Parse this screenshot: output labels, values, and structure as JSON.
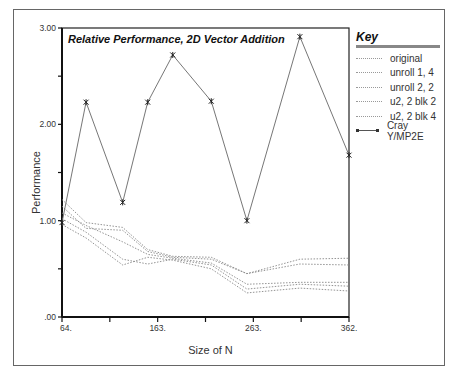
{
  "chart_data": {
    "type": "line",
    "title": "Relative Performance, 2D Vector Addition",
    "xlabel": "Size of N",
    "ylabel": "Performance",
    "ylim": [
      0,
      3
    ],
    "xlim": [
      64,
      362
    ],
    "y_ticks": [
      ".00",
      "1.00",
      "2.00",
      "3.00"
    ],
    "x_ticks": [
      "64.",
      "163.",
      "263.",
      "362."
    ],
    "grid": false,
    "legend_position": "right",
    "legend_title": "Key",
    "x": [
      64,
      89,
      127,
      153,
      179,
      219,
      256,
      311,
      362
    ],
    "series": [
      {
        "name": "original",
        "style": "dotted",
        "values": [
          1.22,
          0.98,
          0.93,
          0.7,
          0.63,
          0.62,
          0.45,
          0.6,
          0.61
        ]
      },
      {
        "name": "unroll 1, 4",
        "style": "dotted",
        "values": [
          1.15,
          0.92,
          0.9,
          0.68,
          0.62,
          0.6,
          0.45,
          0.55,
          0.54
        ]
      },
      {
        "name": "unroll 2, 2",
        "style": "dotted",
        "values": [
          1.08,
          0.95,
          0.78,
          0.65,
          0.61,
          0.56,
          0.34,
          0.36,
          0.36
        ]
      },
      {
        "name": "u2, 2 blk 2",
        "style": "dotted",
        "values": [
          1.02,
          0.88,
          0.6,
          0.55,
          0.6,
          0.54,
          0.29,
          0.34,
          0.32
        ]
      },
      {
        "name": "u2, 2 blk 4",
        "style": "dotted",
        "values": [
          0.96,
          0.82,
          0.54,
          0.62,
          0.59,
          0.5,
          0.25,
          0.3,
          0.27
        ]
      },
      {
        "name": "Cray Y/MP2E",
        "style": "solid-star",
        "values": [
          0.98,
          2.23,
          1.19,
          2.23,
          2.72,
          2.24,
          1.0,
          2.91,
          1.68
        ]
      }
    ]
  }
}
